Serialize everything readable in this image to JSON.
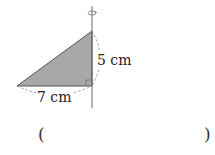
{
  "figure": {
    "shape": "right-triangle",
    "rotation_axis": "vertical",
    "fill_color": "#a8a8a8",
    "legs": {
      "vertical": {
        "label": "5 cm",
        "value": 5,
        "unit": "cm"
      },
      "horizontal": {
        "label": "7 cm",
        "value": 7,
        "unit": "cm"
      }
    },
    "icons": [
      "rotation-arrow-icon",
      "right-angle-mark-icon"
    ]
  },
  "answer": {
    "open_paren": "(",
    "close_paren": ")",
    "value": ""
  }
}
